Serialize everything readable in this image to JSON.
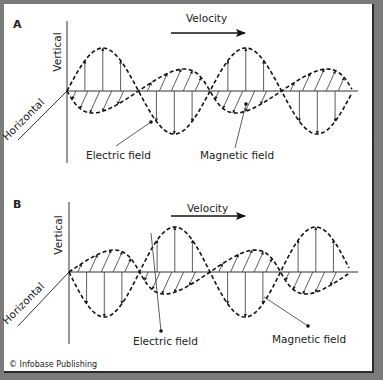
{
  "figure": {
    "credit": "© Infobase Publishing",
    "velocity_label": "Velocity",
    "colors": {
      "frame": "#7b7b7b",
      "panel": "#ffffff",
      "ink": "#222222"
    }
  },
  "panels": [
    {
      "letter": "A",
      "vertical_label": "Vertical",
      "horizontal_label": "Horizontal",
      "electric_label": "Electric field",
      "magnetic_label": "Magnetic field",
      "geometry": {
        "origin_x": 67,
        "axis_y": 91,
        "axis_end_x": 358,
        "wave_end_x": 352,
        "e_amplitude": 43,
        "e_start_sign": 1,
        "wavelength": 143,
        "b_offset_x": 10,
        "b_amplitude": 22,
        "letter_pos": [
          13,
          28
        ],
        "velocity_text_pos": [
          186,
          22
        ],
        "velocity_arrow": [
          171,
          33,
          245
        ],
        "vertical_label_pos": [
          61,
          52
        ],
        "horizontal_line": [
          18,
          140,
          67,
          91
        ],
        "horizontal_label_pos": [
          26,
          122
        ],
        "electric_label_pos": [
          86,
          159
        ],
        "electric_leader": [
          116,
          146,
          151,
          122
        ],
        "magnetic_label_pos": [
          200,
          159
        ],
        "magnetic_leader": [
          235,
          148,
          246,
          104
        ]
      }
    },
    {
      "letter": "B",
      "vertical_label": "Vertical",
      "horizontal_label": "Horizontal",
      "electric_label": "Electric field",
      "magnetic_label": "Magnetic field",
      "geometry": {
        "origin_x": 69,
        "axis_y": 272,
        "axis_end_x": 358,
        "wave_end_x": 350,
        "e_amplitude": 45,
        "e_start_sign": -1,
        "wavelength": 141,
        "b_offset_x": 10,
        "b_amplitude": 22,
        "letter_pos": [
          13,
          208
        ],
        "velocity_text_pos": [
          187,
          212
        ],
        "velocity_arrow": [
          171,
          216,
          245
        ],
        "vertical_label_pos": [
          62,
          235
        ],
        "horizontal_line": [
          18,
          326,
          69,
          272
        ],
        "horizontal_label_pos": [
          26,
          306
        ],
        "electric_label_pos": [
          133,
          345
        ],
        "electric_leader": [
          151,
          233,
          161,
          331
        ],
        "magnetic_label_pos": [
          272,
          343
        ],
        "magnetic_leader": [
          264,
          297,
          308,
          326
        ]
      }
    }
  ],
  "stray_dot": [
    372,
    140
  ]
}
